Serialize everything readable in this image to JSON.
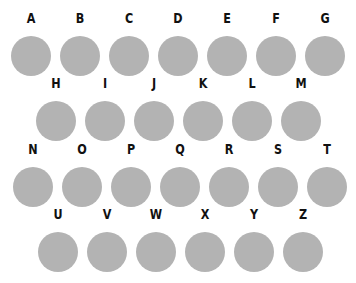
{
  "colors": {
    "circle": "#b3b3b3",
    "letter": "#111111",
    "background": "#ffffff"
  },
  "rows": [
    {
      "letters": [
        "A",
        "B",
        "C",
        "D",
        "E",
        "F",
        "G"
      ]
    },
    {
      "letters": [
        "H",
        "I",
        "J",
        "K",
        "L",
        "M"
      ]
    },
    {
      "letters": [
        "N",
        "O",
        "P",
        "Q",
        "R",
        "S",
        "T"
      ]
    },
    {
      "letters": [
        "U",
        "V",
        "W",
        "X",
        "Y",
        "Z"
      ]
    }
  ]
}
